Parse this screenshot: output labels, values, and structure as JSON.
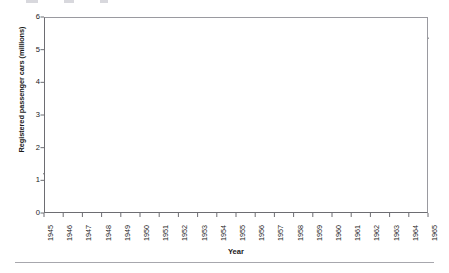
{
  "chart_data": {
    "type": "line",
    "title": "",
    "subtitle": "",
    "xlabel": "Year",
    "ylabel": "Registered passenger cars (millions)",
    "xlim": [
      1945,
      1965
    ],
    "ylim": [
      0,
      6
    ],
    "grid": false,
    "legend": "none",
    "y_ticks": [
      "6",
      "5",
      "4",
      "3",
      "2",
      "1",
      "0"
    ],
    "y_tick_values": [
      6,
      5,
      4,
      3,
      2,
      1,
      0
    ],
    "categories": [
      "1945",
      "1946",
      "1947",
      "1948",
      "1949",
      "1950",
      "1951",
      "1952",
      "1953",
      "1954",
      "1955",
      "1956",
      "1957",
      "1958",
      "1959",
      "1960",
      "1961",
      "1962",
      "1963",
      "1964",
      "1965"
    ],
    "x": [
      1945,
      1946,
      1947,
      1948,
      1949,
      1950,
      1951,
      1952,
      1953,
      1954,
      1955,
      1956,
      1957,
      1958,
      1959,
      1960,
      1961,
      1962,
      1963,
      1964,
      1965
    ],
    "values": [
      1.2,
      1.2,
      1.4,
      1.5,
      1.7,
      1.9,
      2.1,
      2.25,
      2.45,
      2.65,
      2.95,
      3.2,
      3.4,
      3.6,
      3.8,
      4.05,
      4.25,
      4.45,
      4.7,
      5.0,
      5.35
    ],
    "series": [
      {
        "name": "Registered passenger cars",
        "color": "#3a3a3f",
        "values": [
          1.2,
          1.2,
          1.4,
          1.5,
          1.7,
          1.9,
          2.1,
          2.25,
          2.45,
          2.65,
          2.95,
          3.2,
          3.4,
          3.6,
          3.8,
          4.05,
          4.25,
          4.45,
          4.7,
          5.0,
          5.35
        ]
      }
    ]
  },
  "figure": {
    "axis_color": "#6d6d72",
    "line_color": "#3a3a3f",
    "background": "#ffffff",
    "rule_color": "#a7a7ad"
  }
}
